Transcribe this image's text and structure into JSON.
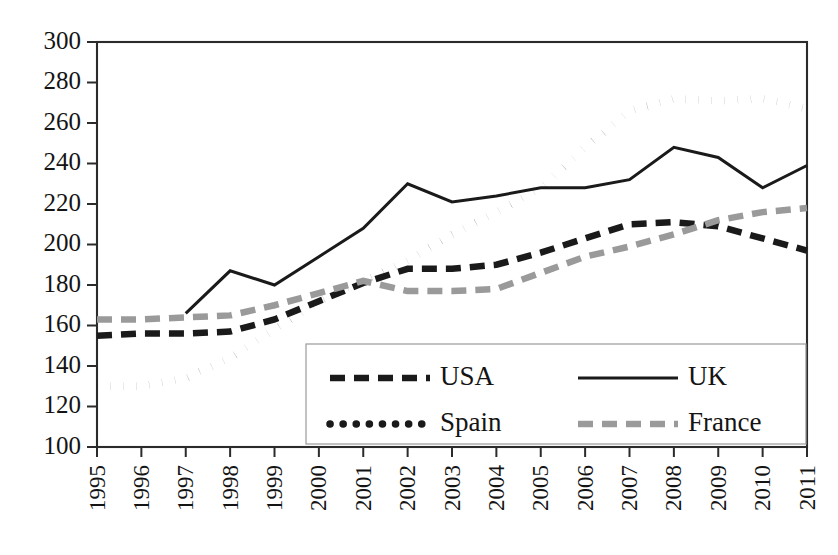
{
  "chart_data": {
    "type": "line",
    "title": "",
    "xlabel": "",
    "ylabel": "",
    "categories": [
      "1995",
      "1996",
      "1997",
      "1998",
      "1999",
      "2000",
      "2001",
      "2002",
      "2003",
      "2004",
      "2005",
      "2006",
      "2007",
      "2008",
      "2009",
      "2010",
      "2011"
    ],
    "x": [
      1995,
      1996,
      1997,
      1998,
      1999,
      2000,
      2001,
      2002,
      2003,
      2004,
      2005,
      2006,
      2007,
      2008,
      2009,
      2010,
      2011
    ],
    "ylim": [
      100,
      300
    ],
    "yticks": [
      100,
      120,
      140,
      160,
      180,
      200,
      220,
      240,
      260,
      280,
      300
    ],
    "grid": false,
    "legend_position": "inside-bottom-center",
    "series": [
      {
        "name": "USA",
        "style": "dashed",
        "color": "#1a1a1a",
        "values": [
          155,
          156,
          156,
          157,
          163,
          172,
          181,
          188,
          188,
          190,
          196,
          203,
          210,
          211,
          209,
          203,
          197
        ]
      },
      {
        "name": "UK",
        "style": "solid",
        "color": "#1a1a1a",
        "values": [
          null,
          null,
          166,
          187,
          180,
          194,
          208,
          230,
          221,
          224,
          228,
          228,
          232,
          248,
          243,
          228,
          239
        ]
      },
      {
        "name": "Spain",
        "style": "dotted",
        "color": "#1a1a1a",
        "values": [
          130,
          130,
          134,
          144,
          158,
          172,
          182,
          192,
          205,
          216,
          228,
          248,
          266,
          272,
          271,
          272,
          267
        ]
      },
      {
        "name": "France",
        "style": "dashed",
        "color": "#9a9a9a",
        "values": [
          163,
          163,
          164,
          165,
          170,
          176,
          182,
          177,
          177,
          178,
          186,
          194,
          199,
          205,
          212,
          216,
          218
        ]
      }
    ]
  },
  "axes": {
    "y_tick_labels": [
      "300",
      "280",
      "260",
      "240",
      "220",
      "200",
      "180",
      "160",
      "140",
      "120",
      "100"
    ],
    "x_tick_labels": [
      "1995",
      "1996",
      "1997",
      "1998",
      "1999",
      "2000",
      "2001",
      "2002",
      "2003",
      "2004",
      "2005",
      "2006",
      "2007",
      "2008",
      "2009",
      "2010",
      "2011"
    ]
  },
  "legend": {
    "entries": [
      {
        "label": "USA",
        "style": "dashed",
        "color": "#1a1a1a"
      },
      {
        "label": "UK",
        "style": "solid",
        "color": "#1a1a1a"
      },
      {
        "label": "Spain",
        "style": "dotted",
        "color": "#1a1a1a"
      },
      {
        "label": "France",
        "style": "dashed",
        "color": "#9a9a9a"
      }
    ]
  }
}
